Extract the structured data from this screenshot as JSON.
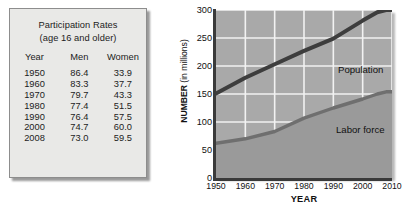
{
  "table": {
    "title_line1": "Participation Rates",
    "title_line2": "(age 16 and older)",
    "columns": [
      "Year",
      "Men",
      "Women"
    ],
    "rows": [
      {
        "year": "1950",
        "men": "86.4",
        "women": "33.9"
      },
      {
        "year": "1960",
        "men": "83.3",
        "women": "37.7"
      },
      {
        "year": "1970",
        "men": "79.7",
        "women": "43.3"
      },
      {
        "year": "1980",
        "men": "77.4",
        "women": "51.5"
      },
      {
        "year": "1990",
        "men": "76.4",
        "women": "57.5"
      },
      {
        "year": "2000",
        "men": "74.7",
        "women": "60.0"
      },
      {
        "year": "2008",
        "men": "73.0",
        "women": "59.5"
      }
    ]
  },
  "chart_labels": {
    "ylabel_bold": "NUMBER",
    "ylabel_rest": " (in millions)",
    "xlabel": "YEAR",
    "population": "Population",
    "labor_force": "Labor force"
  },
  "colors": {
    "plot_background": "#a9a9a9",
    "area_fill": "#9a9a9a",
    "gridline": "#f2f2f2",
    "population_line": "#3d3d3d",
    "labor_line": "#6f6f6f",
    "axis": "#3a3a3a",
    "panel_background": "#e9e9e7",
    "panel_border": "#8d8d8d",
    "text": "#1c1c1c"
  },
  "chart_data": {
    "type": "line",
    "title": "",
    "xlabel": "YEAR",
    "ylabel": "NUMBER (in millions)",
    "xlim": [
      1950,
      2010
    ],
    "ylim": [
      0,
      300
    ],
    "ytick_labels": [
      "0",
      "50",
      "100",
      "150",
      "200",
      "250",
      "300"
    ],
    "yticks": [
      0,
      50,
      100,
      150,
      200,
      250,
      300
    ],
    "xtick_labels": [
      "1950",
      "1960",
      "1970",
      "1980",
      "1990",
      "2000",
      "2010"
    ],
    "xticks": [
      1950,
      1960,
      1970,
      1980,
      1990,
      2000,
      2010
    ],
    "grid": true,
    "legend": "inline-annotations",
    "x": [
      1950,
      1960,
      1970,
      1980,
      1990,
      2000,
      2005,
      2008,
      2010
    ],
    "series": [
      {
        "name": "Population",
        "values": [
          151,
          179,
          203,
          227,
          249,
          281,
          296,
          300,
          300
        ],
        "color": "#3d3d3d",
        "style": "line"
      },
      {
        "name": "Labor force",
        "values": [
          62,
          70,
          83,
          107,
          125,
          141,
          150,
          154,
          154
        ],
        "color": "#6f6f6f",
        "style": "area"
      }
    ]
  }
}
